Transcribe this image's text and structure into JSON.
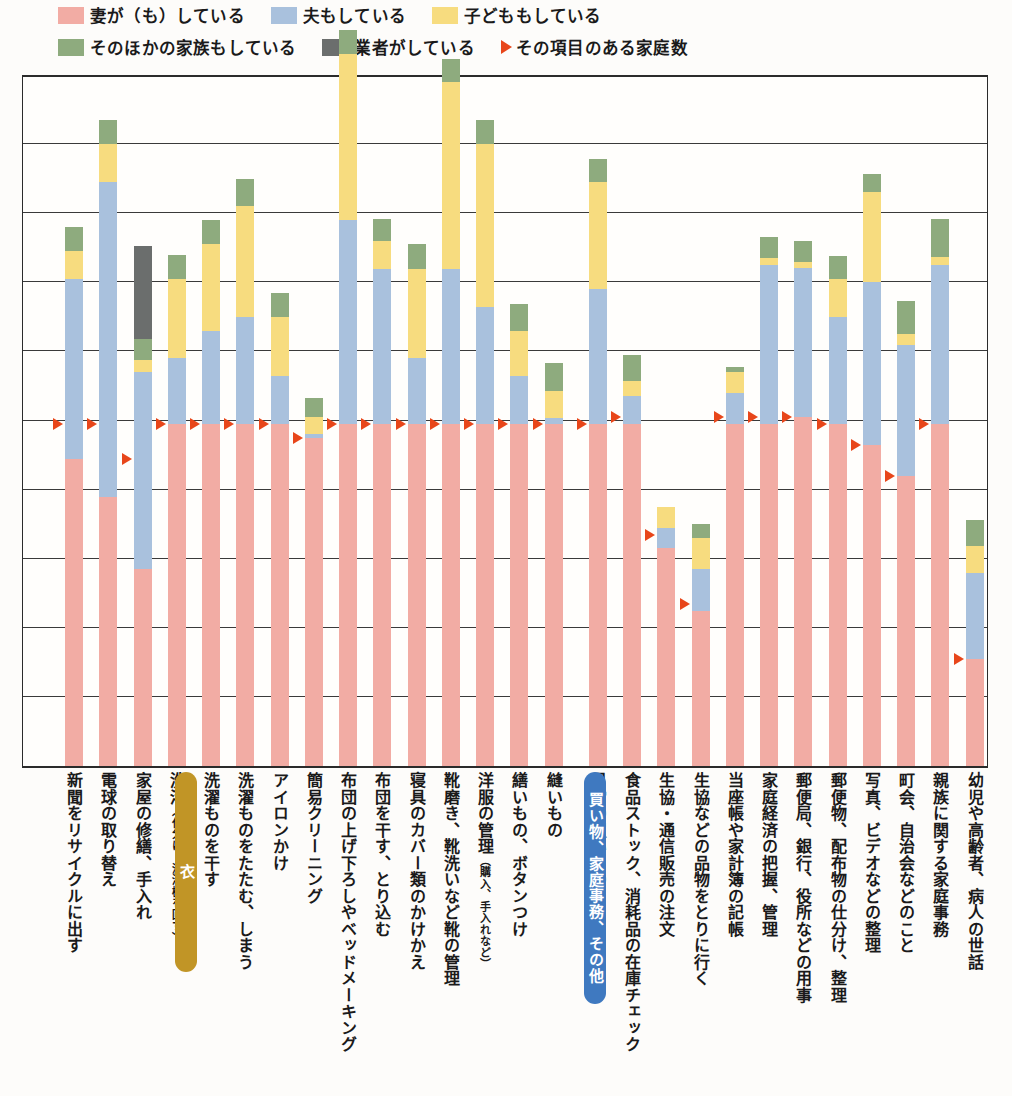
{
  "legend": {
    "items": [
      {
        "label": "妻が（も）している",
        "color": "#f2aca4",
        "icon": "legend-swatch-wife"
      },
      {
        "label": "夫もしている",
        "color": "#a9c1dd",
        "icon": "legend-swatch-husband"
      },
      {
        "label": "子どももしている",
        "color": "#f7dc7f",
        "icon": "legend-swatch-child"
      },
      {
        "label": "そのほかの家族もしている",
        "color": "#8eab7e",
        "icon": "legend-swatch-other-family"
      },
      {
        "label": "業者がしている",
        "color": "#6b6e6d",
        "icon": "legend-swatch-contractor"
      }
    ],
    "marker": {
      "label": "その項目のある家庭数",
      "color": "#e8461a",
      "icon": "triangle-right-icon"
    }
  },
  "banners": [
    {
      "label": "衣",
      "color": "#c19526",
      "x": 153,
      "height": 200
    },
    {
      "label": "買い物、家庭事務、その他",
      "color": "#3f79c0",
      "x": 562,
      "height": 232
    }
  ],
  "chart_data": {
    "type": "bar",
    "title": "",
    "xlabel": "",
    "ylabel": "",
    "stacked": true,
    "grid": true,
    "ylim": [
      0,
      10
    ],
    "gridlines": [
      1,
      2,
      3,
      4,
      5,
      6,
      7,
      8,
      9,
      10
    ],
    "series": [
      {
        "name": "妻が（も）している",
        "key": "wife",
        "color": "#f2aca4"
      },
      {
        "name": "夫もしている",
        "key": "husband",
        "color": "#a9c1dd"
      },
      {
        "name": "子どももしている",
        "key": "child",
        "color": "#f7dc7f"
      },
      {
        "name": "そのほかの家族もしている",
        "key": "other",
        "color": "#8eab7e"
      },
      {
        "name": "業者がしている",
        "key": "contractor",
        "color": "#6b6e6d"
      }
    ],
    "categories": [
      "新聞をリサイクルに出す",
      "電球の取り替え",
      "家屋の修繕、手入れ",
      "洗濯（仕分け、洗濯機を回す）",
      "洗濯ものを干す",
      "洗濯ものをたたむ、しまう",
      "アイロンかけ",
      "簡易クリーニング",
      "布団の上げ下ろしやベッドメーキング",
      "布団を干す、とり込む",
      "寝具のカバー類のかけかえ",
      "靴磨き、靴洗いなど靴の管理",
      "洋服の管理（購入、手入れなど）",
      "繕いもの、ボタンつけ",
      "縫いもの",
      "日常の買いもの",
      "食品ストック、消耗品の在庫チェック",
      "生協・通信販売の注文",
      "生協などの品物をとりに行く",
      "当座帳や家計簿の記帳",
      "家庭経済の把握、管理",
      "郵便局、銀行、役所などの用事",
      "郵便物、配布物の仕分け、整理",
      "写真、ビデオなどの整理",
      "町会、自治会などのこと",
      "親族に関する家庭事務",
      "幼児や高齢者、病人の世話"
    ],
    "bars": [
      {
        "wife": 4.45,
        "husband": 2.6,
        "child": 0.4,
        "other": 0.35,
        "contractor": 0,
        "marker": 4.95
      },
      {
        "wife": 3.9,
        "husband": 4.55,
        "child": 0.55,
        "other": 0.35,
        "contractor": 0,
        "marker": 4.95
      },
      {
        "wife": 2.85,
        "husband": 2.85,
        "child": 0.18,
        "other": 0.3,
        "contractor": 1.35,
        "marker": 4.45
      },
      {
        "wife": 4.95,
        "husband": 0.95,
        "child": 1.15,
        "other": 0.35,
        "contractor": 0,
        "marker": 4.95
      },
      {
        "wife": 4.95,
        "husband": 1.35,
        "child": 1.25,
        "other": 0.35,
        "contractor": 0,
        "marker": 4.95
      },
      {
        "wife": 4.95,
        "husband": 1.55,
        "child": 1.6,
        "other": 0.4,
        "contractor": 0,
        "marker": 4.95
      },
      {
        "wife": 4.95,
        "husband": 0.7,
        "child": 0.85,
        "other": 0.35,
        "contractor": 0,
        "marker": 4.95
      },
      {
        "wife": 4.75,
        "husband": 0.05,
        "child": 0.25,
        "other": 0.27,
        "contractor": 0,
        "marker": 4.75
      },
      {
        "wife": 4.95,
        "husband": 2.95,
        "child": 2.4,
        "other": 0.35,
        "contractor": 0,
        "marker": 4.95
      },
      {
        "wife": 4.95,
        "husband": 2.25,
        "child": 0.4,
        "other": 0.32,
        "contractor": 0,
        "marker": 4.95
      },
      {
        "wife": 4.95,
        "husband": 0.95,
        "child": 1.3,
        "other": 0.35,
        "contractor": 0,
        "marker": 4.95
      },
      {
        "wife": 4.95,
        "husband": 2.25,
        "child": 2.7,
        "other": 0.33,
        "contractor": 0,
        "marker": 4.95
      },
      {
        "wife": 4.95,
        "husband": 1.7,
        "child": 2.35,
        "other": 0.35,
        "contractor": 0,
        "marker": 4.95
      },
      {
        "wife": 4.95,
        "husband": 0.7,
        "child": 0.65,
        "other": 0.38,
        "contractor": 0,
        "marker": 4.95
      },
      {
        "wife": 4.95,
        "husband": 0.08,
        "child": 0.4,
        "other": 0.4,
        "contractor": 0,
        "marker": 4.95
      },
      {
        "wife": 4.95,
        "husband": 1.95,
        "child": 1.55,
        "other": 0.33,
        "contractor": 0,
        "marker": 4.95
      },
      {
        "wife": 4.95,
        "husband": 0.4,
        "child": 0.22,
        "other": 0.38,
        "contractor": 0,
        "marker": 5.05
      },
      {
        "wife": 3.15,
        "husband": 0.3,
        "child": 0.3,
        "other": 0,
        "contractor": 0,
        "marker": 3.35
      },
      {
        "wife": 2.25,
        "husband": 0.6,
        "child": 0.45,
        "other": 0.2,
        "contractor": 0,
        "marker": 2.35
      },
      {
        "wife": 4.95,
        "husband": 0.45,
        "child": 0.3,
        "other": 0.08,
        "contractor": 0,
        "marker": 5.05
      },
      {
        "wife": 4.95,
        "husband": 2.3,
        "child": 0.1,
        "other": 0.3,
        "contractor": 0,
        "marker": 5.05
      },
      {
        "wife": 5.05,
        "husband": 2.15,
        "child": 0.1,
        "other": 0.3,
        "contractor": 0,
        "marker": 5.05
      },
      {
        "wife": 4.95,
        "husband": 1.55,
        "child": 0.55,
        "other": 0.33,
        "contractor": 0,
        "marker": 4.95
      },
      {
        "wife": 4.65,
        "husband": 2.35,
        "child": 1.3,
        "other": 0.27,
        "contractor": 0,
        "marker": 4.65
      },
      {
        "wife": 4.2,
        "husband": 1.9,
        "child": 0.15,
        "other": 0.48,
        "contractor": 0,
        "marker": 4.2
      },
      {
        "wife": 4.95,
        "husband": 2.3,
        "child": 0.12,
        "other": 0.55,
        "contractor": 0,
        "marker": 4.95
      },
      {
        "wife": 1.55,
        "husband": 1.25,
        "child": 0.38,
        "other": 0.38,
        "contractor": 0,
        "marker": 1.55
      }
    ]
  }
}
